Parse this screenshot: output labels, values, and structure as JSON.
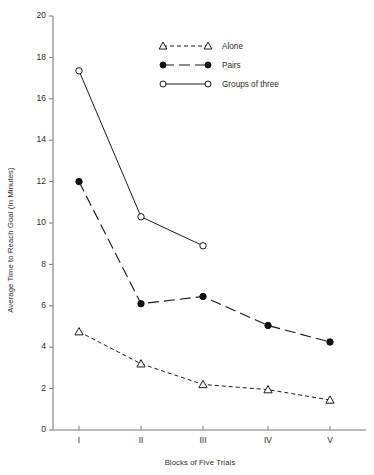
{
  "chart_data": {
    "type": "line",
    "title": "",
    "xlabel": "Blocks of Five Trials",
    "ylabel": "Average Time to Reach Goal (In Minutes)",
    "categories": [
      "I",
      "II",
      "III",
      "IV",
      "V"
    ],
    "xlim": [
      0,
      6
    ],
    "ylim": [
      0,
      20
    ],
    "ytick_step": 2,
    "yticks": [
      "0",
      "2",
      "4",
      "6",
      "8",
      "10",
      "12",
      "14",
      "16",
      "18",
      "20"
    ],
    "grid": false,
    "legend_position": "top-center",
    "series": [
      {
        "name": "Alone",
        "marker": "open-triangle",
        "linestyle": "dashed",
        "values": [
          4.75,
          3.2,
          2.2,
          1.95,
          1.45
        ]
      },
      {
        "name": "Pairs",
        "marker": "filled-circle",
        "linestyle": "long-dash",
        "values": [
          12.0,
          6.1,
          6.45,
          5.05,
          4.25
        ]
      },
      {
        "name": "Groups of three",
        "marker": "open-circle",
        "linestyle": "solid",
        "values": [
          17.35,
          10.3,
          8.9,
          null,
          null
        ]
      }
    ]
  },
  "legend": {
    "items": [
      {
        "label": "Alone"
      },
      {
        "label": "Pairs"
      },
      {
        "label": "Groups of three"
      }
    ]
  },
  "colors": {
    "line": "#1a1a1a",
    "axis": "#7a7a7a",
    "text": "#2b2b2b",
    "background": "#ffffff"
  }
}
